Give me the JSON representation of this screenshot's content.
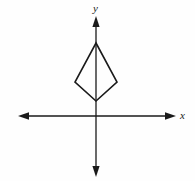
{
  "figure": {
    "background_color": "#fefefe",
    "stroke_color": "#1a1a1a",
    "width": 195,
    "height": 181
  },
  "axes": {
    "x_axis": {
      "label": "x",
      "name": "x-axis",
      "y_position": 116,
      "start_x": 18,
      "end_x": 176,
      "arrow_start": true,
      "arrow_end": true
    },
    "y_axis": {
      "label": "y",
      "name": "y-axis",
      "x_position": 96,
      "start_y": 16,
      "end_y": 177,
      "arrow_start": true,
      "arrow_end": true
    },
    "origin": {
      "x": 96,
      "y": 116
    },
    "tick_labels": [],
    "grid": false
  },
  "shape": {
    "name": "kite",
    "type": "polygon",
    "vertices": [
      {
        "id": "top",
        "x": 96,
        "y": 43
      },
      {
        "id": "right",
        "x": 117,
        "y": 82
      },
      {
        "id": "bottom",
        "x": 96,
        "y": 101
      },
      {
        "id": "left",
        "x": 75,
        "y": 82
      }
    ],
    "points_attr": "96,43 117,82 96,101 75,82",
    "fill": "none",
    "stroke": "#1a1a1a",
    "stroke_width": 1.6
  },
  "annotations": []
}
